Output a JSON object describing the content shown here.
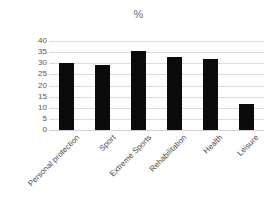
{
  "chart_data": {
    "type": "bar",
    "title": "%",
    "xlabel": "",
    "ylabel": "",
    "categories": [
      "Personal protection",
      "Sport",
      "Extreme Sports",
      "Rehabilitation",
      "Health",
      "Leisure"
    ],
    "values": [
      30,
      29,
      35.5,
      33,
      32,
      11.5
    ],
    "ylim": [
      0,
      40
    ],
    "yticks": [
      0,
      5,
      10,
      15,
      20,
      25,
      30,
      35,
      40
    ],
    "ytick_labels": [
      "0",
      "5",
      "10",
      "15",
      "20",
      "25",
      "30",
      "35",
      "40"
    ],
    "grid": true,
    "legend": false,
    "legend_position": "none",
    "series": [
      {
        "name": "%",
        "values": [
          30,
          29,
          35.5,
          33,
          32,
          11.5
        ]
      }
    ],
    "colors": {
      "bar": "#0b0b0b",
      "gridline": "#dcdcdc",
      "baseline": "#d2d2d2",
      "tick_label": "#555555",
      "category_label": "#4a4a4a",
      "title": "#6a6a6a",
      "background": "#ffffff"
    }
  }
}
